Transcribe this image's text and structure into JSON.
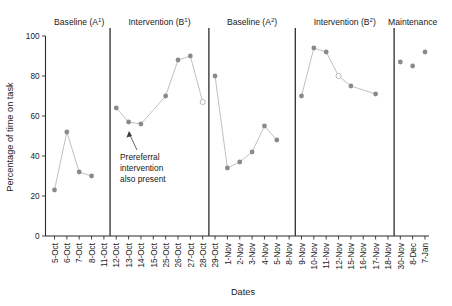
{
  "chart_data": {
    "type": "line",
    "title": "",
    "xlabel": "Dates",
    "ylabel": "Percentage of time on task",
    "ylim": [
      0,
      100
    ],
    "ytick_values": [
      0,
      20,
      40,
      60,
      80,
      100
    ],
    "grid": false,
    "legend": "none",
    "categories": [
      "5-Oct",
      "6-Oct",
      "7-Oct",
      "8-Oct",
      "11-Oct",
      "12-Oct",
      "13-Oct",
      "14-Oct",
      "15-Oct",
      "25-Oct",
      "26-Oct",
      "27-Oct",
      "28-Oct",
      "29-Oct",
      "1-Nov",
      "2-Nov",
      "3-Nov",
      "4-Nov",
      "5-Nov",
      "8-Nov",
      "9-Nov",
      "10-Nov",
      "11-Nov",
      "12-Nov",
      "15-Nov",
      "16-Nov",
      "17-Nov",
      "18-Nov",
      "30-Nov",
      "8-Dec",
      "7-Jan"
    ],
    "values": [
      23,
      52,
      32,
      30,
      null,
      64,
      57,
      56,
      null,
      70,
      88,
      90,
      67,
      80,
      34,
      37,
      42,
      55,
      48,
      null,
      70,
      94,
      92,
      80,
      75,
      null,
      71,
      null,
      87,
      85,
      92
    ],
    "open_markers": [
      "28-Oct",
      "12-Nov"
    ],
    "phases": [
      {
        "name": "Baseline (A",
        "sup": "1",
        "close": ")",
        "start": "5-Oct",
        "end": "11-Oct"
      },
      {
        "name": "Intervention (B",
        "sup": "1",
        "close": ")",
        "start": "12-Oct",
        "end": "28-Oct"
      },
      {
        "name": "Baseline (A",
        "sup": "2",
        "close": ")",
        "start": "29-Oct",
        "end": "8-Nov"
      },
      {
        "name": "Intervention (B",
        "sup": "2",
        "close": ")",
        "start": "9-Nov",
        "end": "18-Nov"
      },
      {
        "name": "Maintenance",
        "sup": "",
        "close": "",
        "start": "30-Nov",
        "end": "7-Jan"
      }
    ],
    "annotation": {
      "line1": "Prereferral",
      "line2": "intervention",
      "line3": "also present"
    },
    "colors": {
      "marker": "#8a8a8a",
      "line": "#b9b9b9",
      "axis": "#2b2b2b",
      "separator": "#3a3a3a",
      "text": "#1a1a1a",
      "background": "#ffffff"
    }
  }
}
